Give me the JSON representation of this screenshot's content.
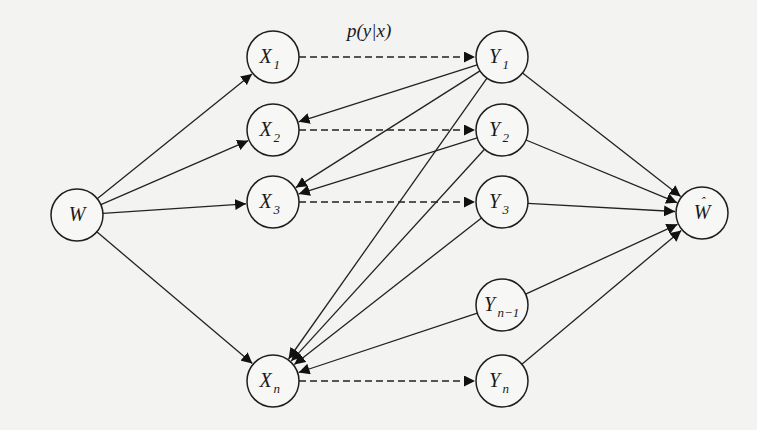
{
  "diagram": {
    "channel_label": "p(y|x)",
    "nodes": [
      {
        "id": "W",
        "base": "W",
        "sub": "",
        "hat": false
      },
      {
        "id": "X1",
        "base": "X",
        "sub": "1",
        "hat": false
      },
      {
        "id": "X2",
        "base": "X",
        "sub": "2",
        "hat": false
      },
      {
        "id": "X3",
        "base": "X",
        "sub": "3",
        "hat": false
      },
      {
        "id": "Xn",
        "base": "X",
        "sub": "n",
        "hat": false
      },
      {
        "id": "Y1",
        "base": "Y",
        "sub": "1",
        "hat": false
      },
      {
        "id": "Y2",
        "base": "Y",
        "sub": "2",
        "hat": false
      },
      {
        "id": "Y3",
        "base": "Y",
        "sub": "3",
        "hat": false
      },
      {
        "id": "Yn-1",
        "base": "Y",
        "sub": "n−1",
        "hat": false
      },
      {
        "id": "Yn",
        "base": "Y",
        "sub": "n",
        "hat": false
      },
      {
        "id": "What",
        "base": "W",
        "sub": "",
        "hat": true
      }
    ],
    "edges": [
      {
        "from": "W",
        "to": "X1",
        "style": "solid"
      },
      {
        "from": "W",
        "to": "X2",
        "style": "solid"
      },
      {
        "from": "W",
        "to": "X3",
        "style": "solid"
      },
      {
        "from": "W",
        "to": "Xn",
        "style": "solid"
      },
      {
        "from": "X1",
        "to": "Y1",
        "style": "dashed"
      },
      {
        "from": "X2",
        "to": "Y2",
        "style": "dashed"
      },
      {
        "from": "X3",
        "to": "Y3",
        "style": "dashed"
      },
      {
        "from": "Xn",
        "to": "Yn",
        "style": "dashed"
      },
      {
        "from": "Y1",
        "to": "X2",
        "style": "solid"
      },
      {
        "from": "Y1",
        "to": "X3",
        "style": "solid"
      },
      {
        "from": "Y1",
        "to": "Xn",
        "style": "solid"
      },
      {
        "from": "Y2",
        "to": "X3",
        "style": "solid"
      },
      {
        "from": "Y2",
        "to": "Xn",
        "style": "solid"
      },
      {
        "from": "Y3",
        "to": "Xn",
        "style": "solid"
      },
      {
        "from": "Yn-1",
        "to": "Xn",
        "style": "solid"
      },
      {
        "from": "Y1",
        "to": "What",
        "style": "solid"
      },
      {
        "from": "Y2",
        "to": "What",
        "style": "solid"
      },
      {
        "from": "Y3",
        "to": "What",
        "style": "solid"
      },
      {
        "from": "Yn-1",
        "to": "What",
        "style": "solid"
      },
      {
        "from": "Yn",
        "to": "What",
        "style": "solid"
      }
    ]
  }
}
